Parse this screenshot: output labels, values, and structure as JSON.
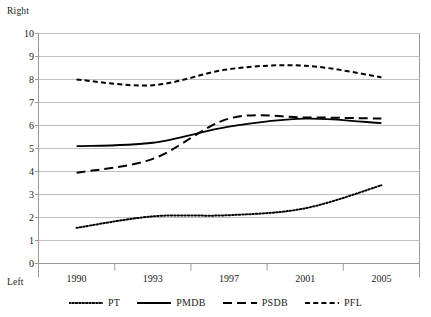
{
  "chart_data": {
    "type": "line",
    "title": "",
    "subtitle": "",
    "xlabel": "",
    "ylabel": "",
    "ylim": [
      0,
      10
    ],
    "xlim": [
      1989,
      2006
    ],
    "grid": true,
    "grid_axis": "y",
    "legend_position": "bottom",
    "axis_pole_high_label": "Right",
    "axis_pole_low_label": "Left",
    "y_ticks": [
      10,
      9,
      8,
      7,
      6,
      5,
      4,
      3,
      2,
      1,
      0
    ],
    "x_ticks": [
      1990,
      1993,
      1997,
      2001,
      2005
    ],
    "x_tick_labels": [
      "1990",
      "1993",
      "1997",
      "2001",
      "2005"
    ],
    "x": [
      1990,
      1993,
      1997,
      2001,
      2005
    ],
    "series": [
      {
        "name": "PT",
        "style": "dotted",
        "color": "#000000",
        "values": [
          1.55,
          2.05,
          2.1,
          2.4,
          3.4
        ]
      },
      {
        "name": "PMDB",
        "style": "solid",
        "color": "#000000",
        "values": [
          5.1,
          5.25,
          5.95,
          6.3,
          6.1
        ]
      },
      {
        "name": "PSDB",
        "style": "dashed-long",
        "color": "#000000",
        "values": [
          3.95,
          4.55,
          6.3,
          6.35,
          6.3
        ]
      },
      {
        "name": "PFL",
        "style": "dashed-short",
        "color": "#000000",
        "values": [
          8.0,
          7.75,
          8.45,
          8.6,
          8.1
        ]
      }
    ]
  },
  "legend": {
    "items": [
      {
        "label": "PT",
        "style": "dotted"
      },
      {
        "label": "PMDB",
        "style": "solid"
      },
      {
        "label": "PSDB",
        "style": "dashed-long"
      },
      {
        "label": "PFL",
        "style": "dashed-short"
      }
    ]
  }
}
